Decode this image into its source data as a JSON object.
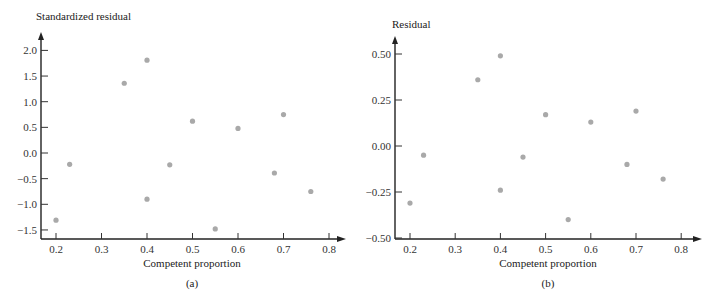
{
  "chart_data": [
    {
      "type": "scatter",
      "panel": "(a)",
      "title": "",
      "xlabel": "Competent proportion",
      "ylabel": "Standardized residual",
      "caption": "(a)",
      "xlim": [
        0.17,
        0.84
      ],
      "ylim": [
        -1.7,
        2.3
      ],
      "xticks": [
        0.2,
        0.3,
        0.4,
        0.5,
        0.6,
        0.7,
        0.8
      ],
      "xtick_labels": [
        "0.2",
        "0.3",
        "0.4",
        "0.5",
        "0.6",
        "0.7",
        "0.8"
      ],
      "yticks": [
        -1.5,
        -1.0,
        -0.5,
        0.0,
        0.5,
        1.0,
        1.5,
        2.0
      ],
      "ytick_labels": [
        "−1.5",
        "−1.0",
        "−0.5",
        "0.0",
        "0.5",
        "1.0",
        "1.5",
        "2.0"
      ],
      "grid": false,
      "legend": null,
      "x": [
        0.2,
        0.23,
        0.35,
        0.4,
        0.4,
        0.45,
        0.5,
        0.55,
        0.6,
        0.68,
        0.7,
        0.76
      ],
      "y": [
        -1.31,
        -0.22,
        1.36,
        1.81,
        -0.9,
        -0.23,
        0.62,
        -1.48,
        0.48,
        -0.39,
        0.75,
        -0.75
      ],
      "marker_color": "#a9a9a9"
    },
    {
      "type": "scatter",
      "panel": "(b)",
      "title": "",
      "xlabel": "Competent proportion",
      "ylabel": "Residual",
      "caption": "(b)",
      "xlim": [
        0.17,
        0.84
      ],
      "ylim": [
        -0.52,
        0.58
      ],
      "xticks": [
        0.2,
        0.3,
        0.4,
        0.5,
        0.6,
        0.7,
        0.8
      ],
      "xtick_labels": [
        "0.2",
        "0.3",
        "0.4",
        "0.5",
        "0.6",
        "0.7",
        "0.8"
      ],
      "yticks": [
        -0.5,
        -0.25,
        0.0,
        0.25,
        0.5
      ],
      "ytick_labels": [
        "−0.50",
        "−0.25",
        "0.00",
        "0.25",
        "0.50"
      ],
      "grid": false,
      "legend": null,
      "x": [
        0.2,
        0.23,
        0.35,
        0.4,
        0.4,
        0.45,
        0.5,
        0.55,
        0.6,
        0.68,
        0.7,
        0.76
      ],
      "y": [
        -0.31,
        -0.05,
        0.36,
        0.49,
        -0.24,
        -0.06,
        0.17,
        -0.4,
        0.13,
        -0.1,
        0.19,
        -0.18
      ],
      "marker_color": "#a9a9a9"
    }
  ]
}
